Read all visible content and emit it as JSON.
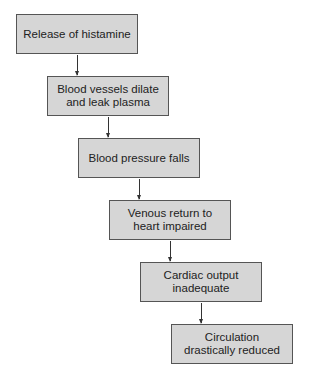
{
  "diagram": {
    "type": "flowchart",
    "nodes": [
      {
        "id": "n1",
        "label": "Release of histamine"
      },
      {
        "id": "n2",
        "label": "Blood vessels dilate\nand leak plasma"
      },
      {
        "id": "n3",
        "label": "Blood pressure falls"
      },
      {
        "id": "n4",
        "label": "Venous return to\nheart impaired"
      },
      {
        "id": "n5",
        "label": "Cardiac output\ninadequate"
      },
      {
        "id": "n6",
        "label": "Circulation\ndrastically reduced"
      }
    ],
    "edges": [
      {
        "from": "n1",
        "to": "n2"
      },
      {
        "from": "n2",
        "to": "n3"
      },
      {
        "from": "n3",
        "to": "n4"
      },
      {
        "from": "n4",
        "to": "n5"
      },
      {
        "from": "n5",
        "to": "n6"
      }
    ],
    "colors": {
      "box_fill": "#d6d6d6",
      "box_border": "#555555",
      "arrow": "#333333"
    }
  }
}
